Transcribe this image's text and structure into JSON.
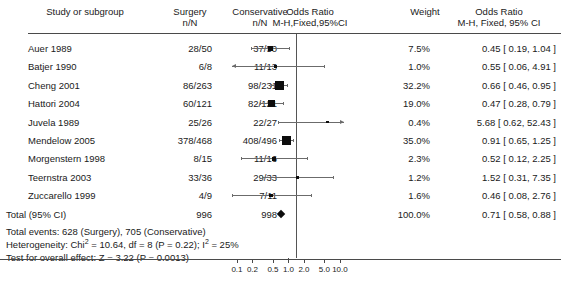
{
  "header": {
    "col_study": "Study or subgroup",
    "col_surgery": "Surgery\nn/N",
    "col_conservative": "Conservative\nn/N",
    "col_or_plot": "Odds Ratio\nM-H,Fixed,95%CI",
    "col_weight": "Weight",
    "col_or_text": "Odds Ratio\nM-H, Fixed, 95% CI"
  },
  "chart_data": {
    "type": "forest",
    "title": "Odds Ratio M-H, Fixed, 95% CI",
    "xlabel": "",
    "ylabel": "",
    "xscale": "log",
    "xlim": [
      0.08,
      12.0
    ],
    "null_value": 1.0,
    "grid": false,
    "legend": "none",
    "axis_ticks": [
      "0.1",
      "0.2",
      "0.5",
      "1.0",
      "2.0",
      "5.0",
      "10.0"
    ],
    "axis_tick_values": [
      0.1,
      0.2,
      0.5,
      1.0,
      2.0,
      5.0,
      10.0
    ],
    "model": "M-H, Fixed, 95% CI",
    "studies": [
      {
        "label": "Auer 1989",
        "surgery": "28/50",
        "conservative": "37/50",
        "weight": "7.5%",
        "weight_value": 7.5,
        "effect": "0.45 [ 0.19, 1.04 ]",
        "or": 0.45,
        "lower": 0.19,
        "upper": 1.04
      },
      {
        "label": "Batjer 1990",
        "surgery": "6/8",
        "conservative": "11/13",
        "weight": "1.0%",
        "weight_value": 1.0,
        "effect": "0.55 [ 0.06, 4.91 ]",
        "or": 0.55,
        "lower": 0.06,
        "upper": 4.91
      },
      {
        "label": "Cheng 2001",
        "surgery": "86/263",
        "conservative": "98/231",
        "weight": "32.2%",
        "weight_value": 32.2,
        "effect": "0.66 [ 0.46, 0.95 ]",
        "or": 0.66,
        "lower": 0.46,
        "upper": 0.95
      },
      {
        "label": "Hattori 2004",
        "surgery": "60/121",
        "conservative": "82/121",
        "weight": "19.0%",
        "weight_value": 19.0,
        "effect": "0.47 [ 0.28, 0.79 ]",
        "or": 0.47,
        "lower": 0.28,
        "upper": 0.79
      },
      {
        "label": "Juvela 1989",
        "surgery": "25/26",
        "conservative": "22/27",
        "weight": "0.4%",
        "weight_value": 0.4,
        "effect": "5.68 [ 0.62, 52.43 ]",
        "or": 5.68,
        "lower": 0.62,
        "upper": 52.43
      },
      {
        "label": "Mendelow 2005",
        "surgery": "378/468",
        "conservative": "408/496",
        "weight": "35.0%",
        "weight_value": 35.0,
        "effect": "0.91 [ 0.65, 1.25 ]",
        "or": 0.91,
        "lower": 0.65,
        "upper": 1.25
      },
      {
        "label": "Morgenstern 1998",
        "surgery": "8/15",
        "conservative": "11/16",
        "weight": "2.3%",
        "weight_value": 2.3,
        "effect": "0.52 [ 0.12, 2.25 ]",
        "or": 0.52,
        "lower": 0.12,
        "upper": 2.25
      },
      {
        "label": "Teernstra 2003",
        "surgery": "33/36",
        "conservative": "29/33",
        "weight": "1.2%",
        "weight_value": 1.2,
        "effect": "1.52 [ 0.31, 7.35 ]",
        "or": 1.52,
        "lower": 0.31,
        "upper": 7.35
      },
      {
        "label": "Zuccarello 1999",
        "surgery": "4/9",
        "conservative": "7/11",
        "weight": "1.6%",
        "weight_value": 1.6,
        "effect": "0.46 [ 0.08, 2.76 ]",
        "or": 0.46,
        "lower": 0.08,
        "upper": 2.76
      }
    ],
    "total": {
      "label": "Total (95% CI)",
      "surgery": "996",
      "conservative": "998",
      "weight": "100.0%",
      "weight_value": 100.0,
      "effect": "0.71 [ 0.58, 0.88 ]",
      "or": 0.71,
      "lower": 0.58,
      "upper": 0.88
    }
  },
  "footer": {
    "total_events": "Total events: 628 (Surgery), 705 (Conservative)",
    "heterogeneity_pre": "Heterogeneity: Chi",
    "heterogeneity_sup1": "2",
    "heterogeneity_mid": " = 10.64, df = 8 (P = 0.22); I",
    "heterogeneity_sup2": "2",
    "heterogeneity_post": " = 25%",
    "overall_effect": "Test for overall effect: Z = 3.22 (P = 0.0013)"
  }
}
